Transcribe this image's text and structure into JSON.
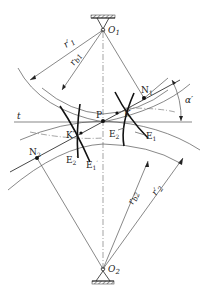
{
  "figure": {
    "labels": {
      "O1": "O",
      "O1_sub": "1",
      "O2": "O",
      "O2_sub": "2",
      "N1": "N",
      "N1_sub": "1",
      "N2": "N",
      "N2_sub": "2",
      "P": "P",
      "t": "t",
      "K": "K",
      "K_prime": "K′",
      "E1": "E",
      "E1_sub": "1",
      "E2": "E",
      "E2_sub": "2",
      "E1_prime": "E",
      "E1_prime_sub": "1",
      "E1_prime_mark": "′",
      "E2_prime": "E",
      "E2_prime_sub": "2",
      "E2_prime_mark": "′",
      "alpha": "α′",
      "r1_prime": "r′",
      "r1_prime_sub": "1",
      "rb1": "r",
      "rb1_sub": "b1",
      "rb2": "r",
      "rb2_sub": "b2",
      "r2_prime": "r′",
      "r2_prime_sub": "2"
    }
  }
}
